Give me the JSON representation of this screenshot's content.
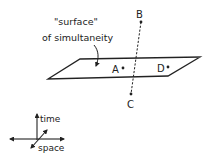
{
  "diagram": {
    "surface_label_line1": "\"surface\"",
    "surface_label_line2": "of simultaneity",
    "points": {
      "A": "A",
      "B": "B",
      "C": "C",
      "D": "D"
    },
    "axes": {
      "time": "time",
      "space": "space"
    },
    "colors": {
      "ink": "#222222",
      "background": "#ffffff"
    }
  }
}
